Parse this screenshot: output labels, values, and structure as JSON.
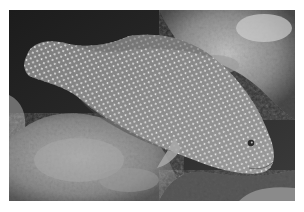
{
  "image": {
    "type": "photograph",
    "mode": "grayscale",
    "subject": "spotted grouper fish resting on coral reef",
    "alt": "Grayscale underwater photograph of a white-spotted grouper lying above coral rubble"
  },
  "palette": {
    "background": "#ffffff",
    "water_dark": "#1e1e1e",
    "reef_light": "#b8b8b8",
    "reef_mid": "#8a8a8a",
    "fish_body": "#8c8c8c",
    "fish_spots": "#e8e8e8"
  }
}
